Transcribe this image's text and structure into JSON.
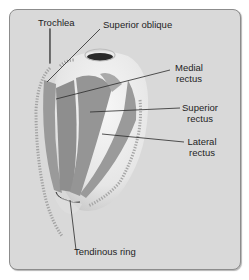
{
  "diagram": {
    "labels": {
      "trochlea": "Trochlea",
      "superior_oblique": "Superior oblique",
      "medial_rectus_1": "Medial",
      "medial_rectus_2": "rectus",
      "superior_rectus_1": "Superior",
      "superior_rectus_2": "rectus",
      "lateral_rectus_1": "Lateral",
      "lateral_rectus_2": "rectus",
      "tendinous_ring": "Tendinous ring"
    },
    "colors": {
      "panel_bg": "#d9d9d9",
      "panel_border": "#8c8c8c",
      "muscle_dark": "#8f8f8f",
      "muscle_mid": "#a8a8a8",
      "eyeball": "#ececec",
      "pupil": "#2a2a2a",
      "leader_line": "#2a2a2a"
    }
  }
}
